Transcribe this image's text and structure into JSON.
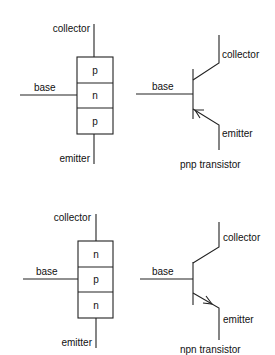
{
  "diagram": {
    "pnp": {
      "block": {
        "collector_label": "collector",
        "base_label": "base",
        "emitter_label": "emitter",
        "layers": [
          "p",
          "n",
          "p"
        ]
      },
      "symbol": {
        "collector_label": "collector",
        "base_label": "base",
        "emitter_label": "emitter",
        "caption": "pnp transistor",
        "arrow_direction": "inward"
      }
    },
    "npn": {
      "block": {
        "collector_label": "collector",
        "base_label": "base",
        "emitter_label": "emitter",
        "layers": [
          "n",
          "p",
          "n"
        ]
      },
      "symbol": {
        "collector_label": "collector",
        "base_label": "base",
        "emitter_label": "emitter",
        "caption": "npn transistor",
        "arrow_direction": "outward"
      }
    }
  }
}
